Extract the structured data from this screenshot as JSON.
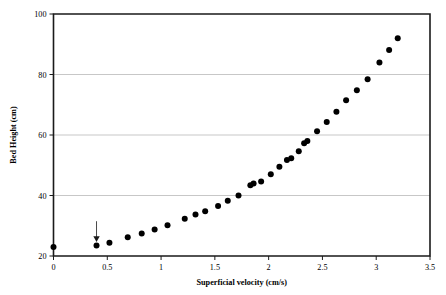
{
  "chart_data": {
    "type": "scatter",
    "title": "",
    "xlabel": "Superficial velocity (cm/s)",
    "ylabel": "Bed Height (cm)",
    "xlim": [
      0,
      3.5
    ],
    "ylim": [
      20,
      100
    ],
    "xticks": [
      0,
      0.5,
      1,
      1.5,
      2,
      2.5,
      3,
      3.5
    ],
    "xticklabels": [
      "0",
      "0.5",
      "1",
      "1.5",
      "2",
      "2.5",
      "3",
      "3.5"
    ],
    "yticks": [
      20,
      40,
      60,
      80,
      100
    ],
    "yticklabels": [
      "20",
      "40",
      "60",
      "80",
      "100"
    ],
    "grid": "horizontal",
    "legend": "none",
    "marker": "filled-circle",
    "marker_color": "#000000",
    "series": [
      {
        "name": "Bed Height",
        "x": [
          0.0,
          0.4,
          0.52,
          0.69,
          0.82,
          0.94,
          1.06,
          1.22,
          1.32,
          1.41,
          1.53,
          1.62,
          1.72,
          1.83,
          1.86,
          1.93,
          2.02,
          2.1,
          2.17,
          2.21,
          2.28,
          2.33,
          2.36,
          2.45,
          2.54,
          2.63,
          2.72,
          2.82,
          2.92,
          3.03,
          3.12,
          3.2
        ],
        "y": [
          23.0,
          23.5,
          24.4,
          26.2,
          27.4,
          28.8,
          30.2,
          32.3,
          33.7,
          34.8,
          36.5,
          38.3,
          40.0,
          43.4,
          44.0,
          44.6,
          47.0,
          49.5,
          51.7,
          52.3,
          54.6,
          57.3,
          58.0,
          61.2,
          64.3,
          67.7,
          71.5,
          74.8,
          78.4,
          84.0,
          88.1,
          92.0
        ]
      }
    ],
    "annotations": [
      {
        "name": "minimum-fluidization-arrow",
        "type": "down-arrow",
        "x": 0.4,
        "y_from": 31.5,
        "y_to": 24.8,
        "label": ""
      }
    ]
  }
}
